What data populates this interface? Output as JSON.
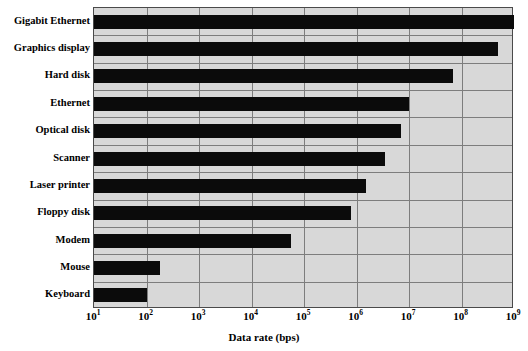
{
  "chart_data": {
    "type": "bar",
    "orientation": "horizontal",
    "title": "",
    "subtitle": "",
    "xlabel": "Data rate (bps)",
    "ylabel": "",
    "xscale": "log",
    "xlim": [
      10,
      1000000000
    ],
    "grid": true,
    "legend": false,
    "legend_position": "none",
    "bar_color": "#0b0b0b",
    "plot_background": "#d8d8d8",
    "grid_color": "#7d7d7d",
    "axis_color": "#4a4a4a",
    "xticks": [
      {
        "value": 10,
        "label": "10",
        "exponent": "1"
      },
      {
        "value": 100,
        "label": "10",
        "exponent": "2"
      },
      {
        "value": 1000,
        "label": "10",
        "exponent": "3"
      },
      {
        "value": 10000,
        "label": "10",
        "exponent": "4"
      },
      {
        "value": 100000,
        "label": "10",
        "exponent": "5"
      },
      {
        "value": 1000000,
        "label": "10",
        "exponent": "6"
      },
      {
        "value": 10000000,
        "label": "10",
        "exponent": "7"
      },
      {
        "value": 100000000,
        "label": "10",
        "exponent": "8"
      },
      {
        "value": 1000000000,
        "label": "10",
        "exponent": "9"
      }
    ],
    "categories": [
      "Gigabit Ethernet",
      "Graphics display",
      "Hard disk",
      "Ethernet",
      "Optical disk",
      "Scanner",
      "Laser printer",
      "Floppy disk",
      "Modem",
      "Mouse",
      "Keyboard"
    ],
    "values": [
      1000000000,
      500000000,
      70000000,
      10000000,
      7000000,
      3500000,
      1500000,
      800000,
      56000,
      180,
      100
    ]
  }
}
